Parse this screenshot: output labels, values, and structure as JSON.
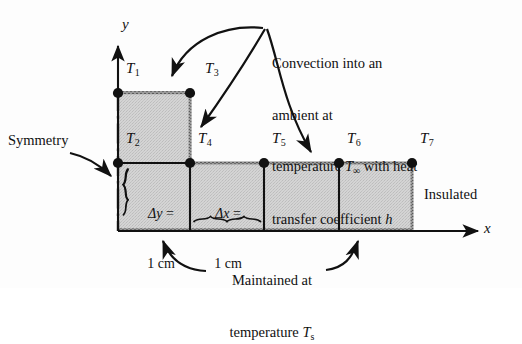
{
  "figure": {
    "background_color": "#fdfdfd",
    "shade_color": "#d2d2d2",
    "line_color": "#111111"
  },
  "axes": {
    "x_label": "x",
    "y_label": "y",
    "x_axis_name": "horizontal-axis",
    "y_axis_name": "vertical-axis"
  },
  "nodes": [
    {
      "id": "T1",
      "symbol": "T",
      "subscript": "1",
      "x": 118,
      "y": 93
    },
    {
      "id": "T2",
      "symbol": "T",
      "subscript": "2",
      "x": 118,
      "y": 163
    },
    {
      "id": "T3",
      "symbol": "T",
      "subscript": "3",
      "x": 190,
      "y": 93
    },
    {
      "id": "T4",
      "symbol": "T",
      "subscript": "4",
      "x": 190,
      "y": 163
    },
    {
      "id": "T5",
      "symbol": "T",
      "subscript": "5",
      "x": 264,
      "y": 163
    },
    {
      "id": "T6",
      "symbol": "T",
      "subscript": "6",
      "x": 339,
      "y": 163
    },
    {
      "id": "T7",
      "symbol": "T",
      "subscript": "7",
      "x": 412,
      "y": 163
    }
  ],
  "annotations": {
    "convection": {
      "lines": [
        "Convection into an",
        "ambient at",
        "temperature T∞ with heat",
        "transfer coefficient h"
      ],
      "line1": "Convection into an",
      "line2": "ambient at",
      "line3_pre": "temperature ",
      "line3_sym": "T",
      "line3_sub": "∞",
      "line3_post": " with heat",
      "line4_pre": "transfer coefficient ",
      "line4_sym": "h"
    },
    "symmetry": {
      "label": "Symmetry"
    },
    "insulated": {
      "label": "Insulated"
    },
    "maintained": {
      "line1": "Maintained at",
      "line2_pre": "temperature ",
      "line2_sym": "T",
      "line2_sub": "s"
    }
  },
  "dimensions": {
    "delta_y": {
      "sym": "Δy",
      "eq": " =",
      "value": "1 cm"
    },
    "delta_x": {
      "sym": "Δx",
      "eq": " =",
      "value": "1 cm"
    }
  }
}
